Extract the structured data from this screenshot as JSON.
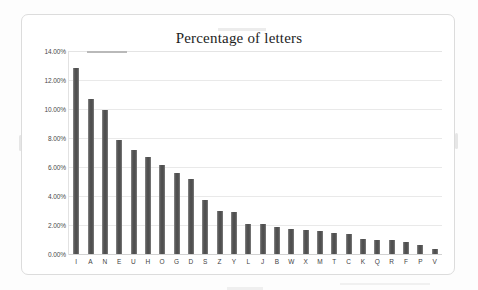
{
  "chart_data": {
    "type": "bar",
    "title": "Percentage of letters",
    "xlabel": "",
    "ylabel": "",
    "ylim": [
      0,
      14
    ],
    "ytick_labels": [
      "14.00%",
      "12.00%",
      "10.00%",
      "8.00%",
      "6.00%",
      "4.00%",
      "2.00%",
      "0.00%"
    ],
    "ytick_values": [
      14,
      12,
      10,
      8,
      6,
      4,
      2,
      0
    ],
    "grid": true,
    "legend": false,
    "value_suffix": "%",
    "categories": [
      "I",
      "A",
      "N",
      "E",
      "U",
      "H",
      "O",
      "G",
      "D",
      "S",
      "Z",
      "Y",
      "L",
      "J",
      "B",
      "W",
      "X",
      "M",
      "T",
      "C",
      "K",
      "Q",
      "R",
      "F",
      "P",
      "V"
    ],
    "values": [
      12.8,
      10.7,
      9.9,
      7.85,
      7.15,
      6.7,
      6.15,
      5.6,
      5.2,
      3.7,
      3.0,
      2.9,
      2.1,
      2.1,
      1.85,
      1.7,
      1.65,
      1.6,
      1.45,
      1.35,
      1.05,
      1.0,
      0.95,
      0.8,
      0.6,
      0.35
    ],
    "bar_color": "#5c5c5c",
    "gridline_color": "#e9e9e9",
    "background_color": "#ffffff",
    "text_color": "#3f3f3f"
  }
}
